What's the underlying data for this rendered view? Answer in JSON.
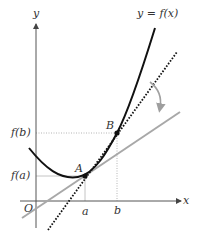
{
  "figure": {
    "curve_label": "y = f(x)",
    "axis_x_label": "x",
    "axis_y_label": "y",
    "origin_label": "O",
    "point_a_label": "A",
    "point_b_label": "B",
    "tick_a_label": "a",
    "tick_b_label": "b",
    "fa_label": "f(a)",
    "fb_label": "f(b)"
  },
  "colors": {
    "curve": "#111111",
    "tangent_line": "#a8a8a8",
    "secant_line": "#111111",
    "axis": "#555555",
    "guide": "#b0b0b0",
    "arrow": "#a0a0a0"
  }
}
